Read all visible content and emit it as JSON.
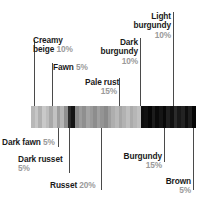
{
  "figure": {
    "type": "proportion-bar"
  },
  "colorbar": {
    "x": 31,
    "y": 106,
    "width": 165,
    "height": 22,
    "border_color": "#7a7a7a",
    "stripes": [
      "#b8b8b8",
      "#c6c6c6",
      "#b0b0b0",
      "#c9c9c9",
      "#bdbdbd",
      "#a8a8a8",
      "#c2c2c2",
      "#9e9e9e",
      "#b5b5b5",
      "#8f8f8f",
      "#2a2a2a",
      "#151515",
      "#8a8a8a",
      "#9c9c9c",
      "#8f8f8f",
      "#a4a4a4",
      "#9a9a9a",
      "#8d8d8d",
      "#a0a0a0",
      "#949494",
      "#8a8a8a",
      "#9e9e9e",
      "#aeaeae",
      "#b9b9b9",
      "#a6a6a6",
      "#b2b2b2",
      "#bfbfbf",
      "#ababab",
      "#b6b6b6",
      "#c0c0c0",
      "#0d0d0d",
      "#111111",
      "#060606",
      "#1c1c1c",
      "#0a0a0a",
      "#151515",
      "#080808",
      "#202020",
      "#101010",
      "#2b2b2b",
      "#181818",
      "#232323",
      "#0e0e0e",
      "#1f1f1f",
      "#050505"
    ]
  },
  "callouts_above": [
    {
      "name": "Creamy beige",
      "percent": "10%",
      "label_x": 33,
      "label_y": 36,
      "align": "left",
      "lines": [
        "Creamy",
        "beige"
      ],
      "percent_on_line": 2,
      "leader_x": 34,
      "leader_y": 40,
      "leader_h": 66
    },
    {
      "name": "Fawn",
      "percent": "5%",
      "label_x": 53,
      "label_y": 63,
      "align": "left",
      "lines": [
        "Fawn"
      ],
      "percent_on_line": 1,
      "leader_x": 52,
      "leader_y": 63,
      "leader_h": 43
    },
    {
      "name": "Pale rust",
      "percent": "15%",
      "label_x": 85,
      "label_y": 78,
      "align": "right",
      "lines": [
        "Pale rust"
      ],
      "percent_on_line": 2,
      "leader_x": 119,
      "leader_y": 78,
      "leader_h": 28
    },
    {
      "name": "Dark burgundy",
      "percent": "10%",
      "label_x": 94,
      "label_y": 38,
      "align": "right",
      "lines": [
        "Dark",
        "burgundy"
      ],
      "percent_on_line": 3,
      "leader_x": 140,
      "leader_y": 38,
      "leader_h": 68
    },
    {
      "name": "Light burgundy",
      "percent": "10%",
      "label_x": 124,
      "label_y": 12,
      "align": "right",
      "lines": [
        "Light",
        "burgundy"
      ],
      "percent_on_line": 3,
      "leader_x": 173,
      "leader_y": 12,
      "leader_h": 94
    }
  ],
  "callouts_below": [
    {
      "name": "Dark fawn",
      "percent": "5%",
      "label_x": 2,
      "label_y": 138,
      "align": "left",
      "lines": [
        "Dark fawn"
      ],
      "percent_on_line": 1,
      "leader_x": 58,
      "leader_y": 128,
      "leader_h": 19
    },
    {
      "name": "Dark russet",
      "percent": "5%",
      "label_x": 18,
      "label_y": 155,
      "align": "left",
      "lines": [
        "Dark russet"
      ],
      "percent_on_line": 2,
      "leader_x": 69,
      "leader_y": 128,
      "leader_h": 45
    },
    {
      "name": "Russet",
      "percent": "20%",
      "label_x": 50,
      "label_y": 181,
      "align": "left",
      "lines": [
        "Russet"
      ],
      "percent_on_line": 1,
      "leader_x": 101,
      "leader_y": 128,
      "leader_h": 62
    },
    {
      "name": "Burgundy",
      "percent": "15%",
      "label_x": 108,
      "label_y": 152,
      "align": "right",
      "lines": [
        "Burgundy"
      ],
      "percent_on_line": 2,
      "leader_x": 164,
      "leader_y": 128,
      "leader_h": 34
    },
    {
      "name": "Brown",
      "percent": "5%",
      "label_x": 128,
      "label_y": 177,
      "align": "right",
      "lines": [
        "Brown"
      ],
      "percent_on_line": 2,
      "leader_x": 193,
      "leader_y": 128,
      "leader_h": 62
    }
  ],
  "chart_data": {
    "type": "bar",
    "title": "",
    "xlabel": "",
    "ylabel": "",
    "categories": [
      "Creamy beige",
      "Fawn",
      "Dark fawn",
      "Dark russet",
      "Russet",
      "Pale rust",
      "Dark burgundy",
      "Light burgundy",
      "Burgundy",
      "Brown"
    ],
    "values": [
      10,
      5,
      5,
      5,
      20,
      15,
      10,
      10,
      15,
      5
    ],
    "value_labels": [
      "10%",
      "5%",
      "5%",
      "5%",
      "20%",
      "15%",
      "10%",
      "10%",
      "15%",
      "5%"
    ],
    "units": "percent",
    "total": 100,
    "orientation": "horizontal-stacked",
    "grid": false,
    "legend": "callout-labels"
  }
}
